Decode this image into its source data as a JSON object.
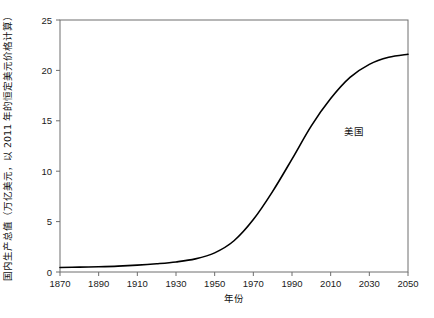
{
  "chart_data": {
    "type": "line",
    "title": "",
    "subtitle": "",
    "xlabel": "年份",
    "ylabel": "国内生产总值（万亿美元，以 2011 年的恒定美元价格计算）",
    "xlim": [
      1870,
      2050
    ],
    "ylim": [
      0,
      25
    ],
    "xticks": [
      1870,
      1890,
      1910,
      1930,
      1950,
      1970,
      1990,
      2010,
      2030,
      2050
    ],
    "xtick_labels": [
      "1870",
      "1890",
      "1910",
      "1930",
      "1950",
      "1970",
      "1990",
      "2010",
      "2030",
      "2050"
    ],
    "yticks": [
      0,
      5,
      10,
      15,
      20,
      25
    ],
    "ytick_labels": [
      "0",
      "5",
      "10",
      "15",
      "20",
      "25"
    ],
    "grid": false,
    "legend_position": "inline-annotation",
    "annotations": [
      {
        "text": "美国",
        "x": 2022,
        "y": 13.6
      }
    ],
    "series": [
      {
        "name": "美国",
        "color": "#000000",
        "line_width": 1.6,
        "x": [
          1870,
          1880,
          1890,
          1900,
          1910,
          1920,
          1930,
          1940,
          1950,
          1960,
          1970,
          1980,
          1990,
          2000,
          2010,
          2020,
          2030,
          2040,
          2050
        ],
        "values": [
          0.45,
          0.48,
          0.52,
          0.58,
          0.68,
          0.82,
          1.0,
          1.3,
          1.9,
          3.1,
          5.2,
          8.0,
          11.2,
          14.5,
          17.2,
          19.3,
          20.6,
          21.3,
          21.6
        ]
      }
    ]
  },
  "axes": {
    "border_color": "#6e6e6e",
    "plot_background": "#ffffff"
  }
}
